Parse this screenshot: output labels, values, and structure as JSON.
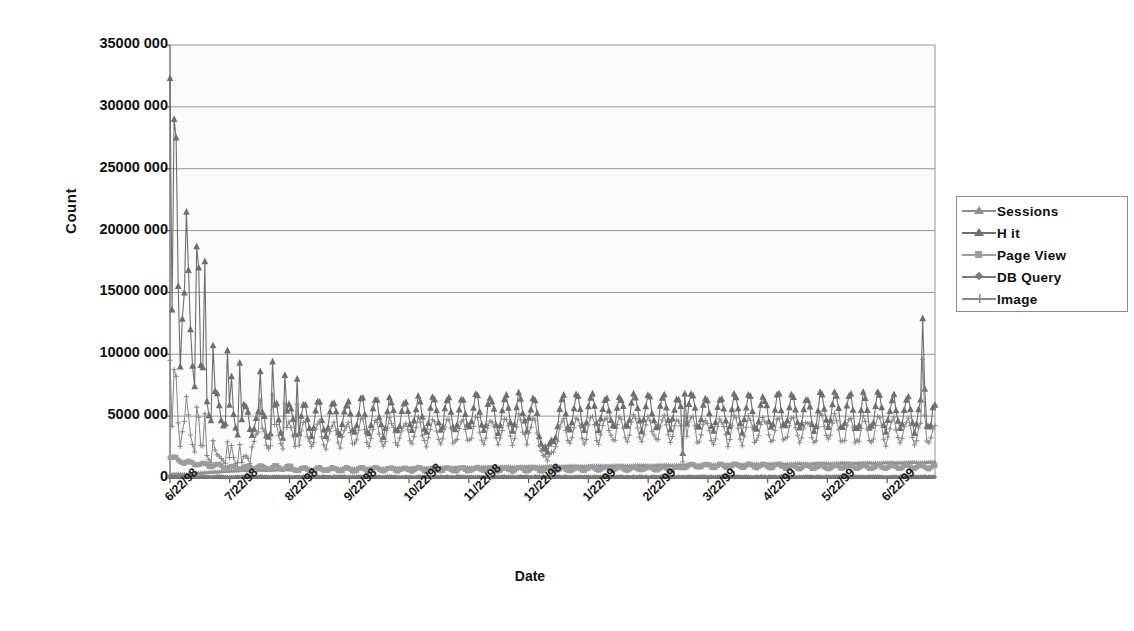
{
  "chart_data": {
    "type": "line",
    "title": "",
    "subtitle": "",
    "xlabel": "Date",
    "ylabel": "Count",
    "grid": true,
    "legend_position": "right",
    "ylim": [
      0,
      35000000
    ],
    "yticks": [
      0,
      5000000,
      10000000,
      15000000,
      20000000,
      25000000,
      30000000,
      35000000
    ],
    "ytick_labels": [
      "0",
      "5000 000",
      "10000 000",
      "15000 000",
      "20000 000",
      "25000 000",
      "30000 000",
      "35000 000"
    ],
    "xtick_labels": [
      "6/22/98",
      "7/22/98",
      "8/22/98",
      "9/22/98",
      "10/22/98",
      "11/22/98",
      "12/22/98",
      "1/22/99",
      "2/22/99",
      "3/22/99",
      "4/22/99",
      "5/22/99",
      "6/22/99"
    ],
    "x_range": [
      "6/22/98",
      "6/30/99"
    ],
    "x_note": "daily samples spanning 6/22/98 to 6/30/99",
    "series": [
      {
        "name": "Sessions",
        "color": "#8f8f8f",
        "marker": "triangle",
        "values": [
          300000,
          320000,
          340000,
          300000,
          280000,
          360000,
          400000,
          420000,
          450000,
          470000,
          500000,
          520000,
          540000,
          560000,
          580000,
          600000,
          620000,
          610000,
          600000,
          640000,
          660000,
          640000,
          620000,
          660000,
          680000,
          700000,
          690000,
          670000,
          700000,
          720000,
          740000,
          720000,
          700000,
          730000,
          750000,
          760000,
          740000,
          720000,
          750000,
          770000,
          780000,
          760000,
          740000,
          770000,
          790000,
          800000,
          780000,
          760000,
          790000,
          810000,
          820000,
          800000,
          780000,
          810000,
          830000,
          840000,
          820000,
          800000,
          830000,
          850000,
          860000,
          840000,
          820000,
          850000,
          870000,
          880000,
          860000,
          840000,
          870000,
          890000,
          900000,
          880000,
          860000,
          890000,
          910000,
          920000,
          900000,
          880000,
          910000,
          930000,
          940000,
          920000,
          900000,
          930000,
          950000,
          960000,
          940000,
          920000,
          950000,
          970000,
          980000,
          960000,
          940000,
          970000,
          990000,
          1000000,
          980000,
          960000,
          990000,
          1010000,
          1020000,
          1000000,
          980000,
          1010000,
          1030000,
          1040000,
          1020000,
          1000000,
          1030000,
          1050000,
          1060000,
          1040000,
          1020000,
          1050000,
          1070000,
          1080000,
          1060000,
          1040000,
          1070000,
          1090000,
          1100000,
          1080000,
          1060000,
          1090000,
          1110000,
          1120000,
          1100000,
          1080000,
          1110000,
          1130000,
          1140000,
          1120000,
          1100000,
          1130000,
          1150000,
          1160000,
          1140000,
          1120000,
          1150000,
          1170000,
          1180000,
          1160000,
          1140000,
          1170000,
          1190000,
          1200000,
          1180000,
          1160000,
          1190000,
          1210000,
          1220000,
          1200000,
          1180000,
          1210000,
          1230000,
          1240000,
          1220000,
          1200000,
          1230000,
          1250000,
          1260000,
          1240000,
          1220000,
          1250000,
          1270000,
          1280000,
          1260000,
          1240000,
          1270000,
          1290000,
          1300000
        ]
      },
      {
        "name": "Hit",
        "color": "#6e6e6e",
        "marker": "triangle-filled",
        "peak_values": [
          29000000,
          27500000,
          21500000,
          18700000,
          17500000,
          13000000
        ],
        "typical_peak": 6500000,
        "typical_trough": 3600000,
        "notes": "huge initial spike decaying over first 6 weeks, then steady weekly oscillation ~3.5M-7M, dip to ~2M near 12/22/98, final spike ~13M at 6/22/99"
      },
      {
        "name": "Page View",
        "color": "#9c9c9c",
        "marker": "square",
        "typical_value": 900000,
        "early_values": [
          1700000,
          1500000,
          1400000,
          1300000,
          1200000,
          1100000,
          1000000
        ],
        "notes": "starts ~1.7M, settles near 0.6M-1.1M with small weekly steps"
      },
      {
        "name": "DB Query",
        "color": "#7a7a7a",
        "marker": "diamond",
        "typical_value": 120000,
        "notes": "flat near zero across the whole range"
      },
      {
        "name": "Image",
        "color": "#888888",
        "marker": "plus",
        "typical_peak": 4800000,
        "typical_trough": 2600000,
        "notes": "tracks below Hit with the same weekly oscillation"
      }
    ]
  },
  "axis": {
    "y_title": "Count",
    "x_title": "Date"
  },
  "legend": {
    "items": [
      {
        "label": "Sessions",
        "marker": "triangle-icon",
        "color": "#8f8f8f"
      },
      {
        "label": "H it",
        "marker": "triangle-filled-icon",
        "color": "#6e6e6e"
      },
      {
        "label": "Page View",
        "marker": "square-icon",
        "color": "#9c9c9c"
      },
      {
        "label": "DB Query",
        "marker": "diamond-icon",
        "color": "#7a7a7a"
      },
      {
        "label": "Image",
        "marker": "plus-icon",
        "color": "#888888"
      }
    ]
  },
  "style": {
    "plot_background": "#fbfbfb",
    "grid_color": "#8b8b8b",
    "axis_color": "#6f6f6f",
    "page_background": "#ffffff",
    "text_color": "#111111"
  }
}
